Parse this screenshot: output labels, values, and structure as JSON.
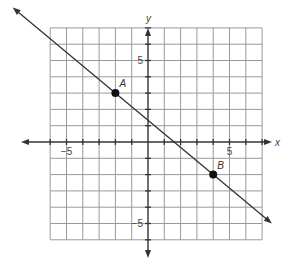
{
  "chart_data": {
    "type": "line",
    "title": "",
    "xlabel": "x",
    "ylabel": "y",
    "grid": true,
    "xlim": [
      -6,
      7
    ],
    "ylim": [
      -6,
      7
    ],
    "x_tick_labels": [
      {
        "value": -5,
        "label": "−5"
      },
      {
        "value": 5,
        "label": "5"
      }
    ],
    "y_tick_labels": [
      {
        "value": 5,
        "label": "5"
      },
      {
        "value": -5,
        "label": "−5"
      }
    ],
    "points": [
      {
        "name": "A",
        "x": -2,
        "y": 3
      },
      {
        "name": "B",
        "x": 4,
        "y": -2
      }
    ],
    "line": {
      "through": [
        "A",
        "B"
      ],
      "slope": -0.8333,
      "y_intercept": 1.3333,
      "x_start": -8.3,
      "x_end": 7.6,
      "arrows": "both"
    }
  }
}
